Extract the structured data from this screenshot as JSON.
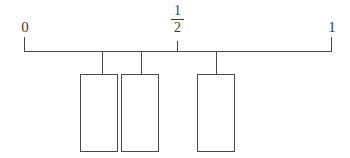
{
  "diagram": {
    "type": "number-line-with-hanging-boxes",
    "colors": {
      "background": "#ffffff",
      "stroke": "#4a4a4a",
      "text": "#3a3a3a",
      "box_fill": "#ffffff"
    },
    "axis": {
      "start_label": "0",
      "end_label": "1",
      "midpoint_label_numerator": "1",
      "midpoint_label_denominator": "2",
      "midpoint_value": "1/2",
      "line_start_x": 24,
      "line_end_x": 332,
      "line_y": 51
    },
    "ticks": [
      {
        "name": "tick-zero",
        "value": "0",
        "x": 24,
        "kind": "endpoint"
      },
      {
        "name": "tick-half",
        "value": "1/2",
        "x": 177,
        "kind": "midpoint"
      },
      {
        "name": "tick-one",
        "value": "1",
        "x": 331,
        "kind": "endpoint"
      }
    ],
    "boxes": [
      {
        "name": "box-1",
        "drop_x": 102,
        "left": 80,
        "width": 38,
        "top": 74,
        "height": 78
      },
      {
        "name": "box-2",
        "drop_x": 141,
        "left": 121,
        "width": 38,
        "top": 74,
        "height": 78
      },
      {
        "name": "box-3",
        "drop_x": 216,
        "left": 197,
        "width": 38,
        "top": 74,
        "height": 78
      }
    ]
  }
}
